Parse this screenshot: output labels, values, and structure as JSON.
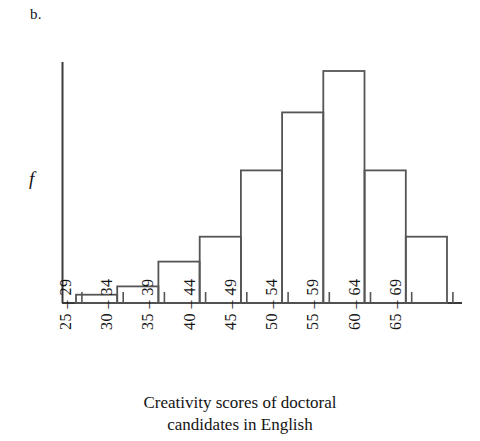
{
  "panel": {
    "label": "b."
  },
  "axes": {
    "y_label": "f",
    "x_tick_labels": [
      "25 – 29",
      "30 – 34",
      "35 – 39",
      "40 – 44",
      "45 – 49",
      "50 – 54",
      "55 – 59",
      "60 – 64",
      "65 – 69"
    ]
  },
  "caption": {
    "line1": "Creativity scores of doctoral",
    "line2": "candidates in English"
  },
  "colors": {
    "line": "#555555",
    "axis": "#3a3a3a",
    "text": "#141414",
    "background": "#ffffff"
  },
  "chart_data": {
    "type": "bar",
    "title": "",
    "subtitle": "",
    "xlabel": "Creativity scores of doctoral candidates in English",
    "ylabel": "f",
    "categories": [
      "25 – 29",
      "30 – 34",
      "35 – 39",
      "40 – 44",
      "45 – 49",
      "50 – 54",
      "55 – 59",
      "60 – 64",
      "65 – 69"
    ],
    "values": [
      1,
      2,
      5,
      8,
      16,
      23,
      28,
      16,
      8
    ],
    "ylim": [
      0,
      29
    ],
    "grid": false,
    "legend": "none",
    "bar_style": "outline-only"
  }
}
